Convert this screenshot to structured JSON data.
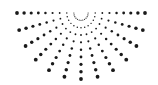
{
  "graphic": {
    "name": "halftone-half-sunburst",
    "color": "#1a1a1a",
    "background": "#ffffff",
    "center": [
      81,
      13
    ],
    "radius_x": 64,
    "radius_y": 66,
    "ray_count": 13,
    "dots_per_ray": 9,
    "min_dot_r": 0.4,
    "max_dot_r": 1.9
  }
}
